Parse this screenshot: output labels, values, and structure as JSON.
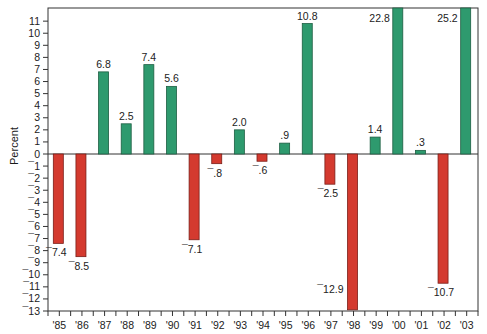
{
  "chart_data": {
    "type": "bar",
    "title": "",
    "xlabel": "",
    "ylabel": "Percent",
    "ylim": [
      -13,
      11
    ],
    "grid": false,
    "legend": null,
    "categories": [
      "'85",
      "'86",
      "'87",
      "'88",
      "'89",
      "'90",
      "'91",
      "'92",
      "'93",
      "'94",
      "'95",
      "'96",
      "'97",
      "'98",
      "'99",
      "'00",
      "'01",
      "'02",
      "'03"
    ],
    "values": [
      -7.4,
      -8.5,
      6.8,
      2.5,
      7.4,
      5.6,
      -7.1,
      -0.8,
      2.0,
      -0.6,
      0.9,
      10.8,
      -2.5,
      -12.9,
      1.4,
      22.8,
      0.3,
      -10.7,
      25.2
    ],
    "data_labels": [
      "¯7.4",
      "¯8.5",
      "6.8",
      "2.5",
      "7.4",
      "5.6",
      "¯7.1",
      "¯.8",
      "2.0",
      "¯.6",
      ".9",
      "10.8",
      "¯2.5",
      "¯12.9",
      "1.4",
      "22.8",
      ".3",
      "¯10.7",
      "25.2"
    ],
    "y_ticks": [
      11,
      10,
      9,
      8,
      7,
      6,
      5,
      4,
      3,
      2,
      1,
      0,
      -1,
      -2,
      -3,
      -4,
      -5,
      -6,
      -7,
      -8,
      -9,
      -10,
      -11,
      -12,
      -13
    ],
    "y_tick_labels": [
      "11",
      "10",
      "9",
      "8",
      "7",
      "6",
      "5",
      "4",
      "3",
      "2",
      "1",
      "0",
      "¯1",
      "¯2",
      "¯3",
      "¯4",
      "¯5",
      "¯6",
      "¯7",
      "¯8",
      "¯9",
      "¯10",
      "¯11",
      "¯12",
      "¯13"
    ],
    "clipped_bars": [
      "'00",
      "'03"
    ],
    "colors": {
      "positive": "#2e9a6e",
      "negative": "#d43a2f",
      "positive_edge": "#1d5e42",
      "negative_edge": "#7a1e18",
      "axis": "#333333"
    }
  },
  "axis": {
    "ylabel": "Percent"
  }
}
